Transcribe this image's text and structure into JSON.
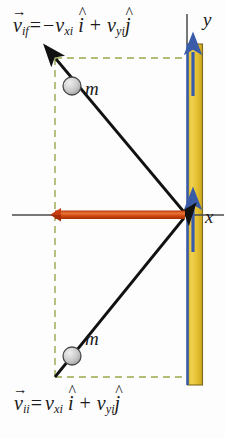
{
  "diagram": {
    "equations": {
      "final_velocity": {
        "symbol": "v",
        "symbol_sub": "if",
        "equals": "=",
        "x_sign": "−",
        "x_component": "v",
        "x_component_sub": "xi",
        "x_unit": "i",
        "plus": "+",
        "y_component": "v",
        "y_component_sub": "yi",
        "y_unit": "j"
      },
      "initial_velocity": {
        "symbol": "v",
        "symbol_sub": "ii",
        "equals": "=",
        "x_sign": "",
        "x_component": "v",
        "x_component_sub": "xi",
        "x_unit": "i",
        "plus": "+",
        "y_component": "v",
        "y_component_sub": "yi",
        "y_unit": "j"
      }
    },
    "axes": {
      "x_label": "x",
      "y_label": "y"
    },
    "mass_labels": {
      "outgoing": "m",
      "incoming": "m"
    },
    "colors": {
      "wall_fill": "#e8c32a",
      "wall_edge": "#3a5ca8",
      "wall_outline": "#6b6b2a",
      "impulse_arrow": "#cc3d10",
      "impulse_arrow_highlight": "#e8763a",
      "velocity_arrow": "#111111",
      "axis": "#4a4a4a",
      "guide_dashed": "#9aa84a",
      "mass_fill": "#c9c9c9",
      "mass_edge": "#4a4a4a",
      "text": "#1a1a1a"
    },
    "elements": {
      "wall_name": "vertical-wall",
      "normal_force_top": "wall-normal-arrow-upper",
      "normal_force_bottom": "wall-normal-arrow-lower",
      "impulse": "impulse-arrow-negative-x",
      "incoming_velocity": "incoming-velocity-arrow",
      "outgoing_velocity": "outgoing-velocity-arrow",
      "guide_rect": "dashed-component-guides"
    }
  }
}
